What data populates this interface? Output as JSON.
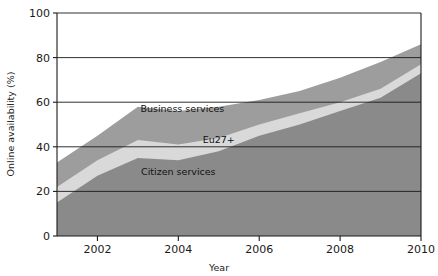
{
  "chart_data": {
    "type": "area",
    "title": "",
    "subtitle": "",
    "xlabel": "Year",
    "ylabel": "Online availability (%)",
    "xlim": [
      2001,
      2010
    ],
    "ylim": [
      0,
      100
    ],
    "grid": true,
    "stacked": true,
    "legend_position": "inline-annotations",
    "x": [
      2001,
      2002,
      2003,
      2004,
      2005,
      2006,
      2007,
      2008,
      2009,
      2010
    ],
    "xticks": [
      2002,
      2004,
      2006,
      2008,
      2010
    ],
    "xtick_labels": [
      "2002",
      "2004",
      "2006",
      "2008",
      "2010"
    ],
    "yticks": [
      0,
      20,
      40,
      60,
      80,
      100
    ],
    "ytick_labels": [
      "0",
      "20",
      "40",
      "60",
      "80",
      "100"
    ],
    "series": [
      {
        "name": "Citizen services",
        "color": "#8a8a8a",
        "values": [
          15,
          27,
          35,
          34,
          38,
          45,
          50,
          56,
          62,
          73
        ]
      },
      {
        "name": "Eu27+",
        "color": "#d9d9d9",
        "values": [
          22,
          34,
          43,
          41,
          44,
          50,
          55,
          60,
          66,
          77
        ]
      },
      {
        "name": "Business services",
        "color": "#9d9d9d",
        "values": [
          33,
          45,
          58,
          56,
          58,
          61,
          65,
          71,
          78,
          86
        ]
      }
    ],
    "annotations": [
      {
        "text": "Business services",
        "x": 2004.1,
        "y": 55.5
      },
      {
        "text": "Eu27+",
        "x": 2005.0,
        "y": 41.5
      },
      {
        "text": "Citizen services",
        "x": 2004.0,
        "y": 27.5
      }
    ]
  },
  "axis": {
    "x_title": "Year",
    "y_title": "Online availability (%)"
  }
}
